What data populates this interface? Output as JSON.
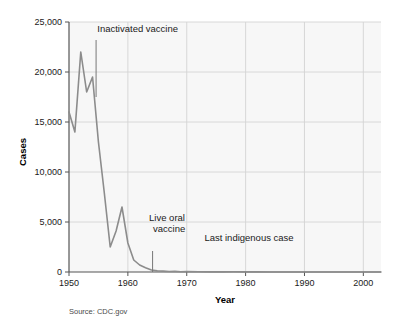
{
  "chart_data": {
    "type": "line",
    "title": "",
    "xlabel": "Year",
    "ylabel": "Cases",
    "xlim": [
      1950,
      2003
    ],
    "ylim": [
      0,
      25000
    ],
    "grid": true,
    "legend": "none",
    "source": "Source: CDC.gov",
    "xticks": [
      "1950",
      "1960",
      "1970",
      "1980",
      "1990",
      "2000"
    ],
    "xtick_values": [
      1950,
      1960,
      1970,
      1980,
      1990,
      2000
    ],
    "yticks": [
      "0",
      "5,000",
      "10,000",
      "15,000",
      "20,000",
      "25,000"
    ],
    "ytick_values": [
      0,
      5000,
      10000,
      15000,
      20000,
      25000
    ],
    "series": [
      {
        "name": "Paralytic poliomyelitis cases",
        "color": "#8c8c8c",
        "x": [
          1950,
          1951,
          1952,
          1953,
          1954,
          1955,
          1956,
          1957,
          1958,
          1959,
          1960,
          1961,
          1962,
          1963,
          1964,
          1965,
          1966,
          1967,
          1968,
          1969,
          1970,
          1972,
          1974,
          1976,
          1978,
          1980,
          1982,
          1984,
          1986,
          1988,
          1990,
          1992,
          1994,
          1996,
          1998,
          2000,
          2002,
          2003
        ],
        "values": [
          16000,
          14000,
          22000,
          18000,
          19500,
          13000,
          7900,
          2500,
          4100,
          6500,
          2900,
          1200,
          700,
          430,
          200,
          110,
          90,
          50,
          60,
          30,
          40,
          30,
          10,
          15,
          20,
          10,
          10,
          5,
          5,
          5,
          5,
          5,
          5,
          5,
          5,
          5,
          5,
          5
        ]
      }
    ],
    "annotations": [
      {
        "id": "inactivated-vaccine",
        "text": "Inactivated vaccine",
        "text_x": 1954.8,
        "text_y": 24000,
        "leader_x": 1954.6,
        "leader_y_top": 23200,
        "leader_y_bottom": 17500
      },
      {
        "id": "live-oral-vaccine",
        "line1": "Live oral",
        "line2": "vaccine",
        "text_x": 1963.6,
        "text_y": 5100,
        "leader_x": 1964.2,
        "leader_y_top": 2100,
        "leader_y_bottom": 0
      },
      {
        "id": "last-indigenous-case",
        "text": "Last indigenous case",
        "text_x": 1973.0,
        "text_y": 3100
      }
    ]
  }
}
